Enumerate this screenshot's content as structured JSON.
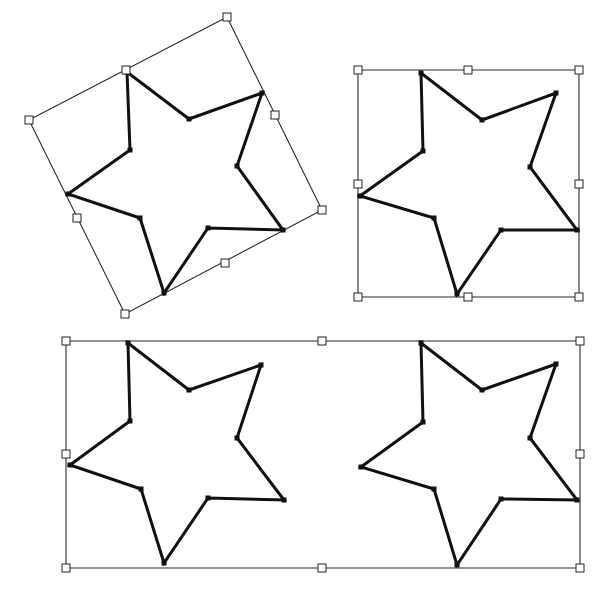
{
  "colors": {
    "background": "#ffffff",
    "star_stroke": "#111111",
    "bbox_stroke": "#2a2a2a",
    "handle_fill": "#ffffff"
  },
  "figures": [
    {
      "name": "rotated-star",
      "description": "Star with rotated selection box",
      "bbox": [
        [
          227,
          17
        ],
        [
          322,
          210
        ],
        [
          125,
          314
        ],
        [
          29,
          120
        ]
      ],
      "handles": [
        [
          227,
          17
        ],
        [
          275,
          115
        ],
        [
          322,
          210
        ],
        [
          225,
          263
        ],
        [
          125,
          314
        ],
        [
          77,
          218
        ],
        [
          29,
          120
        ],
        [
          126,
          70
        ]
      ],
      "star": [
        [
          127,
          72
        ],
        [
          189,
          119
        ],
        [
          262,
          93
        ],
        [
          237,
          166
        ],
        [
          283,
          230
        ],
        [
          208,
          228
        ],
        [
          164,
          293
        ],
        [
          140,
          218
        ],
        [
          68,
          194
        ],
        [
          130,
          150
        ]
      ]
    },
    {
      "name": "axis-aligned-star",
      "description": "Star with axis-aligned selection box",
      "bbox": [
        [
          358,
          70
        ],
        [
          579,
          70
        ],
        [
          579,
          297
        ],
        [
          358,
          297
        ]
      ],
      "handles": [
        [
          358,
          70
        ],
        [
          468,
          70
        ],
        [
          579,
          70
        ],
        [
          579,
          184
        ],
        [
          579,
          297
        ],
        [
          468,
          297
        ],
        [
          358,
          297
        ],
        [
          358,
          184
        ]
      ],
      "star": [
        [
          421,
          73
        ],
        [
          482,
          120
        ],
        [
          556,
          93
        ],
        [
          530,
          167
        ],
        [
          577,
          230
        ],
        [
          501,
          230
        ],
        [
          457,
          294
        ],
        [
          434,
          218
        ],
        [
          360,
          196
        ],
        [
          423,
          151
        ]
      ]
    },
    {
      "name": "group-selection",
      "description": "Two stars in a shared selection box",
      "bbox": [
        [
          66,
          341
        ],
        [
          580,
          341
        ],
        [
          580,
          568
        ],
        [
          66,
          568
        ]
      ],
      "handles": [
        [
          66,
          341
        ],
        [
          322,
          341
        ],
        [
          580,
          341
        ],
        [
          580,
          454
        ],
        [
          580,
          568
        ],
        [
          322,
          568
        ],
        [
          66,
          568
        ],
        [
          66,
          454
        ]
      ],
      "stars": [
        [
          [
            128,
            343
          ],
          [
            189,
            390
          ],
          [
            261,
            365
          ],
          [
            237,
            438
          ],
          [
            284,
            500
          ],
          [
            208,
            498
          ],
          [
            164,
            563
          ],
          [
            141,
            489
          ],
          [
            70,
            465
          ],
          [
            130,
            421
          ]
        ],
        [
          [
            421,
            343
          ],
          [
            482,
            390
          ],
          [
            556,
            364
          ],
          [
            530,
            438
          ],
          [
            577,
            500
          ],
          [
            501,
            499
          ],
          [
            457,
            565
          ],
          [
            434,
            489
          ],
          [
            361,
            467
          ],
          [
            423,
            422
          ]
        ]
      ]
    }
  ]
}
